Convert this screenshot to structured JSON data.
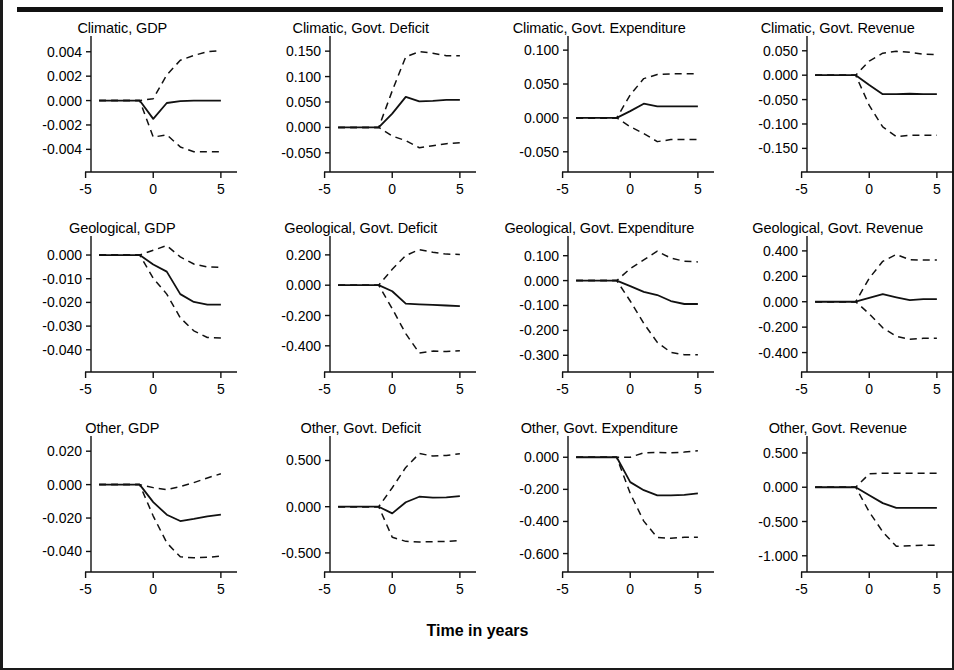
{
  "figure": {
    "xaxis_title": "Time in years",
    "line_color": "#111111",
    "background": "#ffffff",
    "border_color": "#1a1a1a"
  },
  "chart_data": {
    "type": "line",
    "title": "Time in years",
    "xlabel": "Time in years",
    "ylabel": "",
    "grid": false,
    "legend": "none",
    "layout": {
      "rows": 3,
      "cols": 4
    },
    "x": [
      -4,
      -3,
      -2,
      -1,
      0,
      1,
      2,
      3,
      4,
      5
    ],
    "xlim": [
      -4.6,
      5.6
    ],
    "xticks": [
      -5,
      0,
      5
    ],
    "xticklabels": [
      "-5",
      "0",
      "5"
    ],
    "series_styles": [
      "dashed upper band",
      "solid point estimate",
      "dashed lower band"
    ],
    "panels": [
      {
        "title": "Climatic, GDP",
        "row": 1,
        "col": 1,
        "group": "Climatic",
        "variable": "GDP",
        "ylim": [
          -0.0052,
          0.0048
        ],
        "yticks": [
          0.004,
          0.002,
          0.0,
          -0.002,
          -0.004
        ],
        "yticklabels": [
          "0.004",
          "0.002",
          "0.000",
          "-0.002",
          "-0.004"
        ],
        "series": [
          {
            "name": "upper",
            "style": "dashed",
            "values": [
              0.0,
              0.0,
              0.0,
              0.0,
              0.00015,
              0.0021,
              0.0033,
              0.0037,
              0.004,
              0.0041
            ]
          },
          {
            "name": "point",
            "style": "solid",
            "values": [
              0.0,
              0.0,
              0.0,
              0.0,
              -0.0015,
              -0.0002,
              -5e-05,
              0.0,
              0.0,
              0.0
            ]
          },
          {
            "name": "lower",
            "style": "dashed",
            "values": [
              0.0,
              0.0,
              0.0,
              0.0,
              -0.003,
              -0.0028,
              -0.0038,
              -0.0042,
              -0.0042,
              -0.0042
            ]
          }
        ]
      },
      {
        "title": "Climatic, Govt. Deficit",
        "row": 1,
        "col": 2,
        "group": "Climatic",
        "variable": "Govt. Deficit",
        "ylim": [
          -0.072,
          0.168
        ],
        "yticks": [
          0.15,
          0.1,
          0.05,
          0.0,
          -0.05
        ],
        "yticklabels": [
          "0.150",
          "0.100",
          "0.050",
          "0.000",
          "-0.050"
        ],
        "series": [
          {
            "name": "upper",
            "style": "dashed",
            "values": [
              0.0,
              0.0,
              0.0,
              0.0,
              0.072,
              0.139,
              0.149,
              0.146,
              0.141,
              0.141
            ]
          },
          {
            "name": "point",
            "style": "solid",
            "values": [
              0.0,
              0.0,
              0.0,
              0.0,
              0.027,
              0.06,
              0.051,
              0.052,
              0.054,
              0.054
            ]
          },
          {
            "name": "lower",
            "style": "dashed",
            "values": [
              0.0,
              0.0,
              0.0,
              0.0,
              -0.017,
              -0.026,
              -0.04,
              -0.036,
              -0.032,
              -0.03
            ]
          }
        ]
      },
      {
        "title": "Climatic, Govt. Expenditure",
        "row": 1,
        "col": 3,
        "group": "Climatic",
        "variable": "Govt. Expenditure",
        "ylim": [
          -0.068,
          0.112
        ],
        "yticks": [
          0.1,
          0.05,
          0.0,
          -0.05
        ],
        "yticklabels": [
          "0.100",
          "0.050",
          "0.000",
          "-0.050"
        ],
        "series": [
          {
            "name": "upper",
            "style": "dashed",
            "values": [
              0.0,
              0.0,
              0.0,
              0.0,
              0.034,
              0.058,
              0.064,
              0.065,
              0.065,
              0.065
            ]
          },
          {
            "name": "point",
            "style": "solid",
            "values": [
              0.0,
              0.0,
              0.0,
              0.0,
              0.01,
              0.021,
              0.017,
              0.017,
              0.017,
              0.017
            ]
          },
          {
            "name": "lower",
            "style": "dashed",
            "values": [
              0.0,
              0.0,
              0.0,
              0.0,
              -0.013,
              -0.023,
              -0.035,
              -0.032,
              -0.032,
              -0.032
            ]
          }
        ]
      },
      {
        "title": "Climatic, Govt. Revenue",
        "row": 1,
        "col": 4,
        "group": "Climatic",
        "variable": "Govt. Revenue",
        "ylim": [
          -0.182,
          0.068
        ],
        "yticks": [
          0.05,
          0.0,
          -0.05,
          -0.1,
          -0.15
        ],
        "yticklabels": [
          "0.050",
          "0.000",
          "-0.050",
          "-0.100",
          "-0.150"
        ],
        "series": [
          {
            "name": "upper",
            "style": "dashed",
            "values": [
              0.0,
              0.0,
              0.0,
              0.0,
              0.029,
              0.045,
              0.049,
              0.047,
              0.043,
              0.042
            ]
          },
          {
            "name": "point",
            "style": "solid",
            "values": [
              0.0,
              0.0,
              0.0,
              0.0,
              -0.02,
              -0.039,
              -0.039,
              -0.038,
              -0.039,
              -0.039
            ]
          },
          {
            "name": "lower",
            "style": "dashed",
            "values": [
              0.0,
              0.0,
              0.0,
              0.0,
              -0.062,
              -0.106,
              -0.126,
              -0.123,
              -0.123,
              -0.123
            ]
          }
        ]
      },
      {
        "title": "Geological, GDP",
        "row": 2,
        "col": 1,
        "group": "Geological",
        "variable": "GDP",
        "ylim": [
          -0.046,
          0.0055
        ],
        "yticks": [
          0.0,
          -0.01,
          -0.02,
          -0.03,
          -0.04
        ],
        "yticklabels": [
          "0.000",
          "-0.010",
          "-0.020",
          "-0.030",
          "-0.040"
        ],
        "series": [
          {
            "name": "upper",
            "style": "dashed",
            "values": [
              0.0,
              0.0,
              0.0,
              0.0,
              0.002,
              0.004,
              -0.0008,
              -0.0038,
              -0.005,
              -0.0052
            ]
          },
          {
            "name": "point",
            "style": "solid",
            "values": [
              0.0,
              0.0,
              0.0,
              0.0,
              -0.004,
              -0.007,
              -0.0165,
              -0.0198,
              -0.0209,
              -0.0209
            ]
          },
          {
            "name": "lower",
            "style": "dashed",
            "values": [
              0.0,
              0.0,
              0.0,
              0.0,
              -0.0098,
              -0.0165,
              -0.0265,
              -0.032,
              -0.0348,
              -0.035
            ]
          }
        ]
      },
      {
        "title": "Geological, Govt. Deficit",
        "row": 2,
        "col": 2,
        "group": "Geological",
        "variable": "Govt. Deficit",
        "ylim": [
          -0.52,
          0.285
        ],
        "yticks": [
          0.2,
          0.0,
          -0.2,
          -0.4
        ],
        "yticklabels": [
          "0.200",
          "0.000",
          "-0.200",
          "-0.400"
        ],
        "series": [
          {
            "name": "upper",
            "style": "dashed",
            "values": [
              0.0,
              0.0,
              0.0,
              0.0,
              0.105,
              0.196,
              0.235,
              0.218,
              0.205,
              0.203
            ]
          },
          {
            "name": "point",
            "style": "solid",
            "values": [
              0.0,
              0.0,
              0.0,
              0.0,
              -0.04,
              -0.122,
              -0.126,
              -0.13,
              -0.134,
              -0.138
            ]
          },
          {
            "name": "lower",
            "style": "dashed",
            "values": [
              0.0,
              0.0,
              0.0,
              0.0,
              -0.155,
              -0.32,
              -0.448,
              -0.435,
              -0.438,
              -0.432
            ]
          }
        ]
      },
      {
        "title": "Geological, Govt. Expenditure",
        "row": 2,
        "col": 3,
        "group": "Geological",
        "variable": "Govt. Expenditure",
        "ylim": [
          -0.335,
          0.155
        ],
        "yticks": [
          0.1,
          0.0,
          -0.1,
          -0.2,
          -0.3
        ],
        "yticklabels": [
          "0.100",
          "0.000",
          "-0.100",
          "-0.200",
          "-0.300"
        ],
        "series": [
          {
            "name": "upper",
            "style": "dashed",
            "values": [
              0.0,
              0.0,
              0.0,
              0.0,
              0.048,
              0.083,
              0.118,
              0.09,
              0.078,
              0.075
            ]
          },
          {
            "name": "point",
            "style": "solid",
            "values": [
              0.0,
              0.0,
              0.0,
              0.0,
              -0.022,
              -0.045,
              -0.058,
              -0.082,
              -0.094,
              -0.094
            ]
          },
          {
            "name": "lower",
            "style": "dashed",
            "values": [
              0.0,
              0.0,
              0.0,
              0.0,
              -0.082,
              -0.172,
              -0.248,
              -0.288,
              -0.298,
              -0.298
            ]
          }
        ]
      },
      {
        "title": "Geological, Govt. Revenue",
        "row": 2,
        "col": 4,
        "group": "Geological",
        "variable": "Govt. Revenue",
        "ylim": [
          -0.49,
          0.47
        ],
        "yticks": [
          0.4,
          0.2,
          0.0,
          -0.2,
          -0.4
        ],
        "yticklabels": [
          "0.400",
          "0.200",
          "0.000",
          "-0.200",
          "-0.400"
        ],
        "series": [
          {
            "name": "upper",
            "style": "dashed",
            "values": [
              0.0,
              0.0,
              0.0,
              0.0,
              0.185,
              0.318,
              0.372,
              0.33,
              0.328,
              0.328
            ]
          },
          {
            "name": "point",
            "style": "solid",
            "values": [
              0.0,
              0.0,
              0.0,
              0.0,
              0.03,
              0.06,
              0.035,
              0.012,
              0.02,
              0.02
            ]
          },
          {
            "name": "lower",
            "style": "dashed",
            "values": [
              0.0,
              0.0,
              0.0,
              0.0,
              -0.095,
              -0.205,
              -0.272,
              -0.295,
              -0.288,
              -0.288
            ]
          }
        ]
      },
      {
        "title": "Other, GDP",
        "row": 3,
        "col": 1,
        "group": "Other",
        "variable": "GDP",
        "ylim": [
          -0.0475,
          0.0255
        ],
        "yticks": [
          0.02,
          0.0,
          -0.02,
          -0.04
        ],
        "yticklabels": [
          "0.020",
          "0.000",
          "-0.020",
          "-0.040"
        ],
        "series": [
          {
            "name": "upper",
            "style": "dashed",
            "values": [
              0.0,
              0.0,
              0.0,
              0.0,
              -0.0018,
              -0.003,
              -0.0012,
              0.0012,
              0.004,
              0.0065
            ]
          },
          {
            "name": "point",
            "style": "solid",
            "values": [
              0.0,
              0.0,
              0.0,
              0.0,
              -0.0105,
              -0.018,
              -0.0218,
              -0.0205,
              -0.019,
              -0.018
            ]
          },
          {
            "name": "lower",
            "style": "dashed",
            "values": [
              0.0,
              0.0,
              0.0,
              0.0,
              -0.0188,
              -0.0348,
              -0.0432,
              -0.0438,
              -0.0435,
              -0.0428
            ]
          }
        ]
      },
      {
        "title": "Other, Govt. Deficit",
        "row": 3,
        "col": 2,
        "group": "Other",
        "variable": "Govt. Deficit",
        "ylim": [
          -0.62,
          0.7
        ],
        "yticks": [
          0.5,
          0.0,
          -0.5
        ],
        "yticklabels": [
          "0.500",
          "0.000",
          "-0.500"
        ],
        "series": [
          {
            "name": "upper",
            "style": "dashed",
            "values": [
              0.0,
              0.0,
              0.0,
              0.0,
              0.205,
              0.425,
              0.575,
              0.548,
              0.555,
              0.572
            ]
          },
          {
            "name": "point",
            "style": "solid",
            "values": [
              0.0,
              0.0,
              0.0,
              0.0,
              -0.072,
              0.048,
              0.108,
              0.098,
              0.1,
              0.115
            ]
          },
          {
            "name": "lower",
            "style": "dashed",
            "values": [
              0.0,
              0.0,
              0.0,
              0.0,
              -0.33,
              -0.375,
              -0.382,
              -0.378,
              -0.375,
              -0.368
            ]
          }
        ]
      },
      {
        "title": "Other, Govt. Expenditure",
        "row": 3,
        "col": 3,
        "group": "Other",
        "variable": "Govt. Expenditure",
        "ylim": [
          -0.665,
          0.095
        ],
        "yticks": [
          0.0,
          -0.2,
          -0.4,
          -0.6
        ],
        "yticklabels": [
          "0.000",
          "-0.200",
          "-0.400",
          "-0.600"
        ],
        "series": [
          {
            "name": "upper",
            "style": "dashed",
            "values": [
              0.0,
              0.0,
              0.0,
              0.0,
              0.0,
              0.028,
              0.03,
              0.028,
              0.032,
              0.04
            ]
          },
          {
            "name": "point",
            "style": "solid",
            "values": [
              0.0,
              0.0,
              0.0,
              0.0,
              -0.155,
              -0.205,
              -0.238,
              -0.238,
              -0.235,
              -0.225
            ]
          },
          {
            "name": "lower",
            "style": "dashed",
            "values": [
              0.0,
              0.0,
              0.0,
              0.0,
              -0.225,
              -0.398,
              -0.5,
              -0.505,
              -0.498,
              -0.498
            ]
          }
        ]
      },
      {
        "title": "Other, Govt. Revenue",
        "row": 3,
        "col": 4,
        "group": "Other",
        "variable": "Govt. Revenue",
        "ylim": [
          -1.12,
          0.66
        ],
        "yticks": [
          0.5,
          0.0,
          -0.5,
          -1.0
        ],
        "yticklabels": [
          "0.500",
          "0.000",
          "-0.500",
          "-1.000"
        ],
        "series": [
          {
            "name": "upper",
            "style": "dashed",
            "values": [
              0.0,
              0.0,
              0.0,
              0.0,
              0.195,
              0.205,
              0.205,
              0.205,
              0.205,
              0.205
            ]
          },
          {
            "name": "point",
            "style": "solid",
            "values": [
              0.0,
              0.0,
              0.0,
              0.0,
              -0.118,
              -0.232,
              -0.302,
              -0.302,
              -0.302,
              -0.302
            ]
          },
          {
            "name": "lower",
            "style": "dashed",
            "values": [
              0.0,
              0.0,
              0.0,
              0.0,
              -0.36,
              -0.65,
              -0.862,
              -0.855,
              -0.845,
              -0.845
            ]
          }
        ]
      }
    ]
  }
}
